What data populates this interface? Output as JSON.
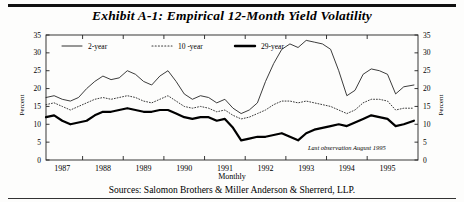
{
  "title": "Exhibit A-1: Empirical 12-Month Yield Volatility",
  "source_note": "Sources: Salomon Brothers & Miller Anderson & Sherrerd, LLP.",
  "annotation": "Last observation August 1995",
  "axes": {
    "y_left_label": "Percent",
    "y_right_label": "Percent",
    "x_label": "Monthly",
    "y_ticks": [
      "0",
      "5",
      "10",
      "15",
      "20",
      "25",
      "30",
      "35"
    ],
    "x_ticks": [
      "1987",
      "1988",
      "1989",
      "1990",
      "1991",
      "1992",
      "1993",
      "1994",
      "1995"
    ]
  },
  "legend": {
    "items": [
      {
        "label": "2-year",
        "style": "thin-solid",
        "color": "#1a1a1a"
      },
      {
        "label": "10 -year",
        "style": "dotted",
        "color": "#3a3a3a"
      },
      {
        "label": "29-year",
        "style": "thick-solid",
        "color": "#000000"
      }
    ]
  },
  "chart_data": {
    "type": "line",
    "title": "Exhibit A-1: Empirical 12-Month Yield Volatility",
    "xlabel": "Monthly",
    "ylabel": "Percent",
    "ylim": [
      0,
      35
    ],
    "xlim": [
      1986.6,
      1995.75
    ],
    "grid": false,
    "legend_position": "top-inside",
    "annotation": "Last observation August 1995",
    "x": [
      1986.6,
      1986.8,
      1987.0,
      1987.2,
      1987.4,
      1987.6,
      1987.8,
      1988.0,
      1988.2,
      1988.4,
      1988.6,
      1988.8,
      1989.0,
      1989.2,
      1989.4,
      1989.6,
      1989.8,
      1990.0,
      1990.2,
      1990.4,
      1990.6,
      1990.8,
      1991.0,
      1991.2,
      1991.4,
      1991.6,
      1991.8,
      1992.0,
      1992.2,
      1992.4,
      1992.6,
      1992.8,
      1993.0,
      1993.2,
      1993.4,
      1993.6,
      1993.8,
      1994.0,
      1994.2,
      1994.4,
      1994.6,
      1994.8,
      1995.0,
      1995.2,
      1995.4,
      1995.65
    ],
    "series": [
      {
        "name": "2-year",
        "style": "thin-solid",
        "color": "#1a1a1a",
        "values": [
          17.5,
          18.0,
          17.0,
          16.5,
          17.5,
          20.0,
          22.0,
          23.5,
          22.5,
          23.0,
          25.0,
          24.0,
          22.0,
          21.0,
          23.5,
          25.0,
          22.0,
          18.5,
          17.0,
          18.0,
          17.5,
          16.0,
          17.0,
          14.5,
          13.0,
          14.0,
          16.0,
          22.0,
          27.0,
          31.0,
          32.5,
          31.5,
          33.5,
          33.0,
          32.5,
          31.0,
          25.0,
          18.0,
          19.5,
          24.0,
          25.5,
          25.0,
          24.0,
          18.5,
          20.5,
          21.0
        ]
      },
      {
        "name": "10 -year",
        "style": "dotted",
        "color": "#3a3a3a",
        "values": [
          15.5,
          16.0,
          15.0,
          14.0,
          15.0,
          16.0,
          17.0,
          17.5,
          17.0,
          17.5,
          18.0,
          17.5,
          16.5,
          16.0,
          17.0,
          18.0,
          16.5,
          15.0,
          14.5,
          15.0,
          14.5,
          13.5,
          14.0,
          12.5,
          11.5,
          12.0,
          13.0,
          14.0,
          15.5,
          16.5,
          16.5,
          16.0,
          16.5,
          16.0,
          15.5,
          15.0,
          14.0,
          13.0,
          14.0,
          16.0,
          17.0,
          17.0,
          16.5,
          14.0,
          14.5,
          14.5
        ]
      },
      {
        "name": "29-year",
        "style": "thick-solid",
        "color": "#000000",
        "values": [
          12.0,
          12.5,
          11.0,
          10.0,
          10.5,
          11.0,
          12.5,
          13.5,
          13.5,
          14.0,
          14.5,
          14.0,
          13.5,
          13.5,
          14.0,
          14.0,
          13.0,
          12.0,
          11.5,
          12.0,
          12.0,
          11.0,
          11.5,
          9.0,
          5.5,
          6.0,
          6.5,
          6.5,
          7.0,
          7.5,
          6.5,
          5.5,
          7.5,
          8.5,
          9.0,
          9.5,
          10.0,
          9.5,
          10.5,
          11.5,
          12.5,
          12.0,
          11.5,
          9.5,
          10.0,
          11.0
        ]
      }
    ]
  }
}
